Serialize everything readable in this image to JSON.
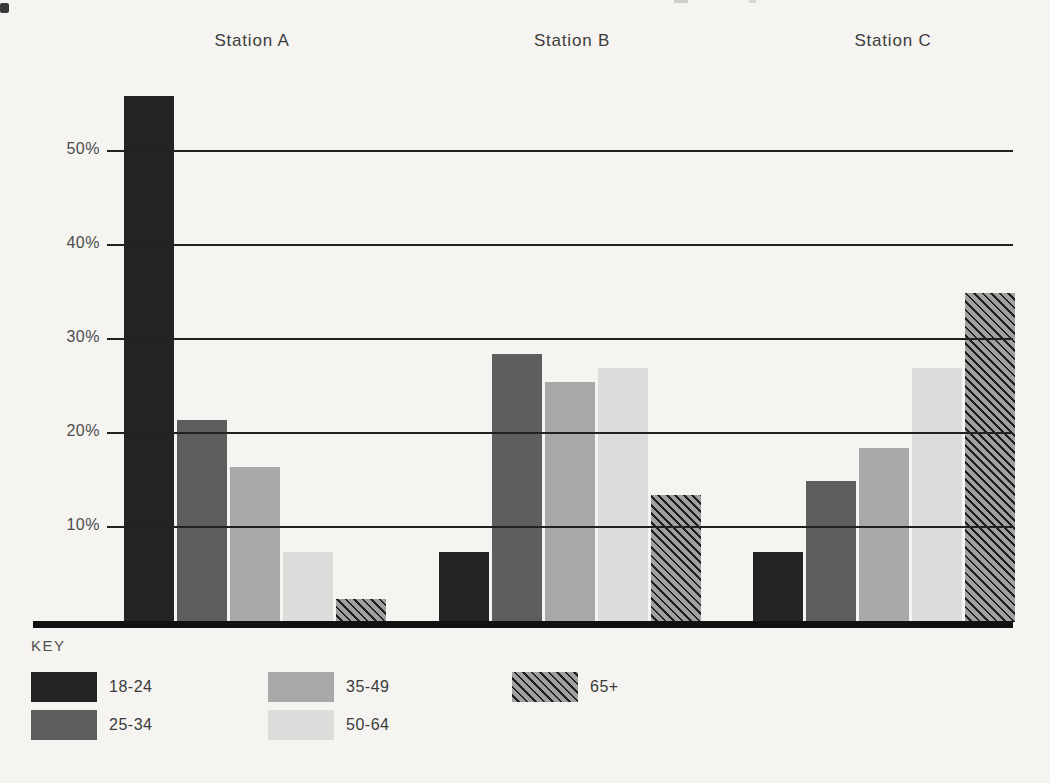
{
  "chart_data": {
    "type": "bar",
    "title": "",
    "xlabel": "",
    "ylabel": "",
    "groups": [
      "Station A",
      "Station B",
      "Station C"
    ],
    "series": [
      {
        "name": "18-24",
        "color": "#232323",
        "pattern": "solid",
        "values": [
          56,
          7.5,
          7.5
        ]
      },
      {
        "name": "25-34",
        "color": "#5e5e5e",
        "pattern": "solid",
        "values": [
          21.5,
          28.5,
          15.0
        ]
      },
      {
        "name": "35-49",
        "color": "#a8a8a8",
        "pattern": "solid",
        "values": [
          16.5,
          25.5,
          18.5
        ]
      },
      {
        "name": "50-64",
        "color": "#dddcda",
        "pattern": "solid",
        "values": [
          7.5,
          27.0,
          27.0
        ]
      },
      {
        "name": "65+",
        "color": "#a0a0a0",
        "stripe_color": "#1f1f1f",
        "pattern": "diagonal-hatch",
        "values": [
          2.5,
          13.5,
          35.0
        ]
      }
    ],
    "y_ticks": [
      "50%",
      "40%",
      "30%",
      "20%",
      "10%"
    ],
    "y_tick_values": [
      50,
      40,
      30,
      20,
      10
    ],
    "ylim": [
      0,
      58
    ],
    "grid": true,
    "grid_over_bars": true,
    "legend_title": "KEY",
    "legend_position": "bottom-left",
    "unit": "percent"
  },
  "page": {
    "background_color": "#f5f4f1",
    "axis_color": "#111111",
    "gridline_color": "#222120",
    "text_color": "#3b3b3b"
  }
}
